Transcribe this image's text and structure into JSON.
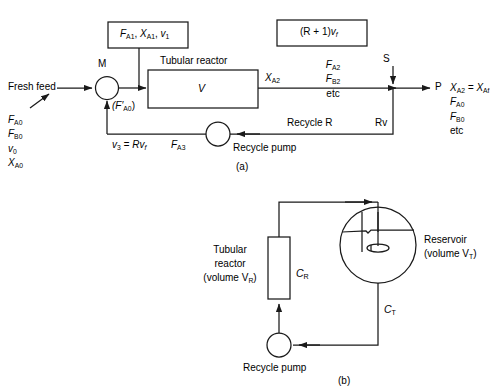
{
  "figure": {
    "caption_a": "(a)",
    "caption_b": "(b)"
  },
  "diagram_a": {
    "fresh_feed_label": "Fresh feed",
    "feed_stream": {
      "l1": "F",
      "l1s": "A0",
      "l2": "F",
      "l2s": "B0",
      "l3": "v",
      "l3s": "0",
      "l4": "X",
      "l4s": "A0"
    },
    "mixer_label": "M",
    "mixer_outlet_label": "(F′",
    "mixer_outlet_sub": "A0",
    "mixer_outlet_close": ")",
    "top_box": {
      "t1": "F",
      "t1s": "A1",
      "t2": "X",
      "t2s": "A1",
      "t3": "v",
      "t3s": "1",
      "sep": ", "
    },
    "reactor_title": "Tubular reactor",
    "reactor_volume": "V",
    "flow_box": {
      "pre": "(R + 1)",
      "v": "v",
      "vs": "f"
    },
    "outlet_conv": "X",
    "outlet_conv_sub": "A2",
    "mid_stream": {
      "m1": "F",
      "m1s": "A2",
      "m2": "F",
      "m2s": "B2",
      "m3": "etc"
    },
    "splitter_label": "S",
    "product_label": "P",
    "product_stream": {
      "p1a": "X",
      "p1as": "A2",
      "p1b": " = X",
      "p1bs": "Af",
      "p2": "F",
      "p2s": "A0",
      "p3": "F",
      "p3s": "B0",
      "p4": "etc"
    },
    "recycle_label": "Recycle R",
    "recycle_flow": "Rv",
    "recycle_stream_v": "v",
    "recycle_stream_v_sub": "3",
    "recycle_stream_eq": " = Rv",
    "recycle_stream_eq_sub": "f",
    "recycle_fa3": "F",
    "recycle_fa3_sub": "A3",
    "pump_label": "Recycle pump"
  },
  "diagram_b": {
    "reactor_line1": "Tubular",
    "reactor_line2": "reactor",
    "reactor_line3a": "(volume V",
    "reactor_line3s": "R",
    "reactor_line3b": ")",
    "reactor_conc": "C",
    "reactor_conc_sub": "R",
    "reservoir_line1": "Reservoir",
    "reservoir_line2a": "(volume V",
    "reservoir_line2s": "T",
    "reservoir_line2b": ")",
    "tank_conc": "C",
    "tank_conc_sub": "T",
    "pump_label": "Recycle pump"
  },
  "colors": {
    "stroke": "#1a1a1a",
    "background": "#ffffff"
  }
}
